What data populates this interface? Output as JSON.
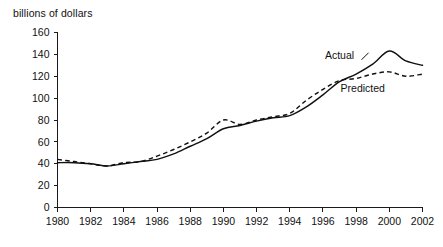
{
  "chart_data": {
    "type": "line",
    "title": "",
    "ylabel": "billions of dollars",
    "xlabel": "",
    "ylim": [
      0,
      160
    ],
    "xlim": [
      1980,
      2002
    ],
    "yticks": [
      0,
      20,
      40,
      60,
      80,
      100,
      120,
      140,
      160
    ],
    "xticks": [
      1980,
      1982,
      1984,
      1986,
      1988,
      1990,
      1992,
      1994,
      1996,
      1998,
      2000,
      2002
    ],
    "xtick_labels": [
      "1980",
      "1982",
      "1984",
      "1986",
      "1988",
      "1990",
      "1992",
      "1994",
      "1996",
      "1998",
      "2000",
      "2002"
    ],
    "ytick_labels": [
      "0",
      "20",
      "40",
      "60",
      "80",
      "100",
      "120",
      "140",
      "160"
    ],
    "grid": false,
    "legend_position": "inline-annotation",
    "x": [
      1980,
      1981,
      1982,
      1983,
      1984,
      1985,
      1986,
      1987,
      1988,
      1989,
      1990,
      1991,
      1992,
      1993,
      1994,
      1995,
      1996,
      1997,
      1998,
      1999,
      2000,
      2001,
      2002
    ],
    "series": [
      {
        "name": "Actual",
        "style": "solid",
        "color": "#111111",
        "values": [
          41,
          41,
          40,
          38,
          40,
          42,
          44,
          49,
          56,
          63,
          72,
          75,
          79,
          82,
          84,
          92,
          103,
          115,
          122,
          131,
          143,
          134,
          130
        ]
      },
      {
        "name": "Predicted",
        "style": "dashed",
        "color": "#111111",
        "values": [
          44,
          42,
          40,
          38,
          41,
          42,
          47,
          53,
          60,
          68,
          80,
          76,
          80,
          83,
          86,
          98,
          108,
          116,
          118,
          122,
          124,
          120,
          122
        ]
      }
    ],
    "annotations": [
      {
        "text": "Actual",
        "x": 1997.0,
        "y": 136
      },
      {
        "text": "Predicted",
        "x": 1998.4,
        "y": 106
      }
    ]
  }
}
